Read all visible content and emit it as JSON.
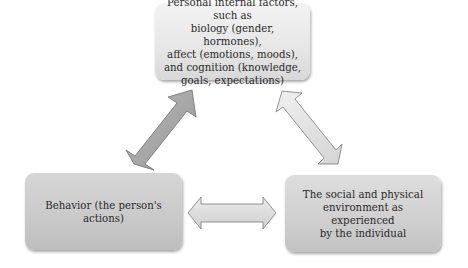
{
  "diagram": {
    "type": "triadic reciprocal model",
    "nodes": {
      "top": {
        "label": "Personal internal factors, such as\nbiology (gender, hormones),\naffect (emotions, moods),\nand cognition (knowledge,\ngoals, expectations)"
      },
      "bottom_left": {
        "label": "Behavior (the person's\nactions)"
      },
      "bottom_right": {
        "label": "The social and physical\nenvironment as experienced\nby the individual"
      }
    },
    "edges": [
      {
        "from": "top",
        "to": "bottom_left",
        "direction": "bidirectional",
        "color": "#a9a9a9"
      },
      {
        "from": "top",
        "to": "bottom_right",
        "direction": "bidirectional",
        "color": "#e4e4e4"
      },
      {
        "from": "bottom_left",
        "to": "bottom_right",
        "direction": "bidirectional",
        "color": "#d8d8d8"
      }
    ]
  }
}
